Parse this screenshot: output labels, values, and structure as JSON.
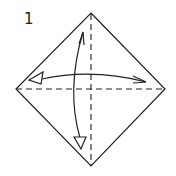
{
  "diagram": {
    "type": "origami-step",
    "step_number": "1",
    "shape": "square-on-point",
    "vertices": {
      "top": [
        91,
        13
      ],
      "right": [
        165,
        89
      ],
      "bottom": [
        91,
        166
      ],
      "left": [
        16,
        89
      ]
    },
    "fold_lines": [
      {
        "name": "horizontal-diagonal",
        "style": "valley-dashed",
        "from": [
          16,
          89
        ],
        "to": [
          165,
          89
        ]
      },
      {
        "name": "vertical-diagonal",
        "style": "valley-dashed",
        "from": [
          91,
          13
        ],
        "to": [
          91,
          166
        ]
      }
    ],
    "arrows": [
      {
        "name": "horizontal-fold-unfold-arrow",
        "meaning": "fold and unfold",
        "from": [
          146,
          82
        ],
        "to": [
          29,
          80
        ]
      },
      {
        "name": "vertical-fold-unfold-arrow",
        "meaning": "fold and unfold",
        "from": [
          83,
          32
        ],
        "to": [
          81,
          149
        ]
      }
    ],
    "colors": {
      "line": "#222222",
      "background": "#ffffff"
    }
  }
}
